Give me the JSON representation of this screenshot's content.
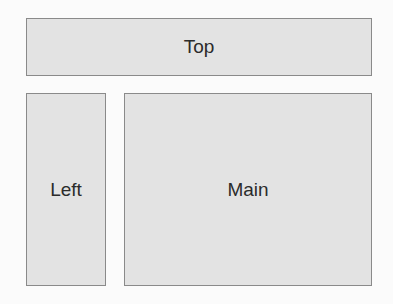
{
  "diagram": {
    "regions": [
      {
        "id": "top",
        "label": "Top"
      },
      {
        "id": "left",
        "label": "Left"
      },
      {
        "id": "main",
        "label": "Main"
      }
    ]
  },
  "colors": {
    "box_fill": "#e3e3e3",
    "box_border": "#8a8a8a",
    "text": "#2b2b2b",
    "background": "#fbfbfb"
  }
}
